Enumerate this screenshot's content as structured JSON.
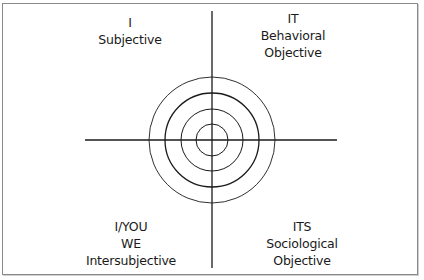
{
  "diagram": {
    "type": "four-quadrant",
    "colors": {
      "line": "#1a1a1a",
      "border": "#8a8a8a",
      "background": "#ffffff",
      "text": "#1a1a1a"
    },
    "center": {
      "x": 212,
      "y": 140
    },
    "axes": {
      "horizontal": {
        "x1": 85,
        "x2": 337,
        "y": 140
      },
      "vertical": {
        "x": 212,
        "y1": 11,
        "y2": 268
      }
    },
    "circles": {
      "count": 4,
      "radii": [
        63,
        47,
        31,
        16
      ]
    },
    "quadrants": {
      "upper_left": {
        "line1": "I",
        "line2": "Subjective"
      },
      "upper_right": {
        "line1": "IT",
        "line2": "Behavioral",
        "line3": "Objective"
      },
      "lower_left": {
        "line1": "I/YOU",
        "line2": "WE",
        "line3": "Intersubjective"
      },
      "lower_right": {
        "line1": "ITS",
        "line2": "Sociological",
        "line3": "Objective"
      }
    }
  }
}
